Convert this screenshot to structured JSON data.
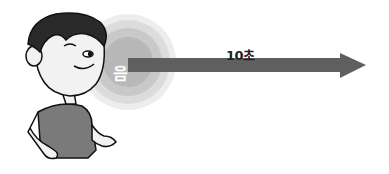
{
  "diagram": {
    "sound_label": "음",
    "arrow_label": "10초",
    "colors": {
      "arrow": "#5f5f5f",
      "circle_outer": "#e6e6e6",
      "circle_mid": "#cfcfcf",
      "circle_inner": "#b5b5b5",
      "shirt": "#7a7a7a",
      "hair": "#2a2a2a",
      "skin": "#f2f2f2"
    }
  }
}
